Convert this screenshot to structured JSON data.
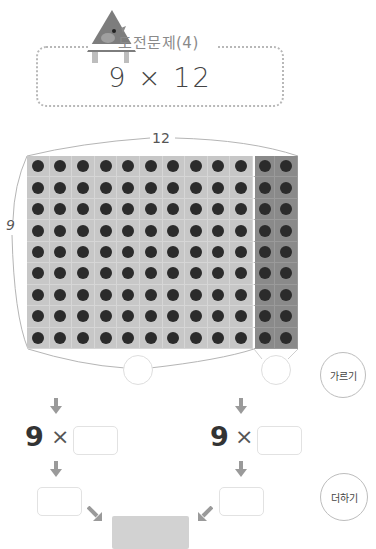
{
  "header": {
    "title": "도전문제(4)",
    "mascot_icon": "triangle-bird-icon"
  },
  "problem": {
    "expression": "9 × 12",
    "multiplicand": "9",
    "operator": "×",
    "multiplier": "12"
  },
  "grid": {
    "rows": 9,
    "cols": 12,
    "split_col": 10,
    "top_label": "12",
    "left_label": "9",
    "colors": {
      "light": "#c7c7c7",
      "dark": "#8a8a8a",
      "dot": "#2b2b2b"
    }
  },
  "bubbles": {
    "divide": "가르기",
    "add": "더하기"
  },
  "left_branch": {
    "factor": "9",
    "operator": "×",
    "input_value": "",
    "result_value": ""
  },
  "right_branch": {
    "factor": "9",
    "operator": "×",
    "input_value": "",
    "result_value": ""
  },
  "sum": {
    "value": ""
  }
}
